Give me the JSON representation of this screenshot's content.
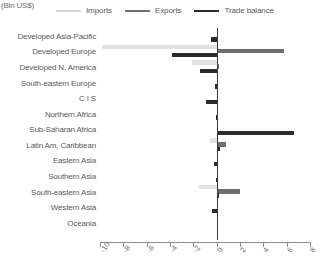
{
  "axis_unit_label": "(Bln US$)",
  "legend": {
    "position": "top",
    "items": [
      {
        "label": "Imports",
        "key": "imports",
        "color": "#d8d8d8"
      },
      {
        "label": "Exports",
        "key": "exports",
        "color": "#6e6e6e"
      },
      {
        "label": "Trade balance",
        "key": "balance",
        "color": "#2b2b2b"
      }
    ]
  },
  "chart_data": {
    "type": "bar",
    "orientation": "horizontal",
    "title": "",
    "subtitle": "",
    "xlabel": "(Bln US$)",
    "ylabel": "",
    "xlim": [
      -10,
      8
    ],
    "xticks": [
      -10,
      -8,
      -6,
      -4,
      -2,
      0,
      2,
      4,
      6,
      8
    ],
    "xtick_labels": [
      "-10",
      "-8",
      "-6",
      "-4",
      "-2",
      "0",
      "2",
      "4",
      "6",
      "8"
    ],
    "grid": false,
    "legend_position": "top",
    "categories": [
      "Developed Asia-Pacific",
      "Developed Europe",
      "Developed N. America",
      "South-eastern Europe",
      "C I S",
      "Northern Africa",
      "Sub-Saharan Africa",
      "Latin Am, Caribbean",
      "Eastern Asia",
      "Southern Asia",
      "South-eastern Asia",
      "Western Asia",
      "Oceania"
    ],
    "series": [
      {
        "name": "Imports",
        "color": "#d8d8d8",
        "values": [
          0.0,
          -9.8,
          -2.1,
          0.0,
          0.0,
          0.0,
          0.0,
          -0.6,
          0.0,
          0.0,
          -1.5,
          0.0,
          0.0
        ]
      },
      {
        "name": "Exports",
        "color": "#6e6e6e",
        "values": [
          0.0,
          5.8,
          0.2,
          0.0,
          0.0,
          0.0,
          0.0,
          0.8,
          0.0,
          0.0,
          2.0,
          0.0,
          0.0
        ]
      },
      {
        "name": "Trade balance",
        "color": "#2b2b2b",
        "values": [
          -0.5,
          -3.8,
          -1.4,
          -0.15,
          -0.9,
          -0.1,
          6.6,
          0.3,
          -0.2,
          -0.1,
          0.2,
          -0.4,
          0.02
        ]
      }
    ]
  }
}
